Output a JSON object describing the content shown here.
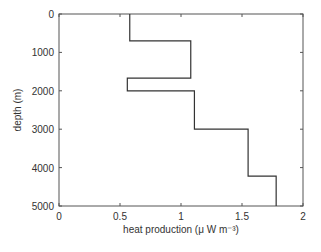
{
  "chart_data": {
    "type": "line",
    "subtype": "step-profile",
    "title": "",
    "xlabel": "heat production (μ W m⁻³)",
    "ylabel": "depth (m)",
    "xlim": [
      0,
      2
    ],
    "ylim": [
      5000,
      0
    ],
    "y_inverted": true,
    "grid": false,
    "legend": null,
    "x_ticks": [
      0,
      0.5,
      1,
      1.5,
      2
    ],
    "x_tick_labels": [
      "0",
      "0.5",
      "1",
      "1.5",
      "2"
    ],
    "y_ticks": [
      0,
      1000,
      2000,
      3000,
      4000,
      5000
    ],
    "y_tick_labels": [
      "0",
      "1000",
      "2000",
      "3000",
      "4000",
      "5000"
    ],
    "layers": [
      {
        "depth_top": 0,
        "depth_bottom": 700,
        "heat_production": 0.58
      },
      {
        "depth_top": 700,
        "depth_bottom": 1670,
        "heat_production": 1.08
      },
      {
        "depth_top": 1670,
        "depth_bottom": 2000,
        "heat_production": 0.56
      },
      {
        "depth_top": 2000,
        "depth_bottom": 3000,
        "heat_production": 1.11
      },
      {
        "depth_top": 3000,
        "depth_bottom": 4220,
        "heat_production": 1.55
      },
      {
        "depth_top": 4220,
        "depth_bottom": 5000,
        "heat_production": 1.78
      }
    ],
    "line_color": "#333333"
  }
}
